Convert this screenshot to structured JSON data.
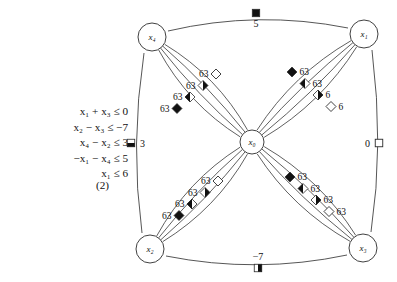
{
  "equations": {
    "lines": [
      "x₁ + x₃ ≤ 0",
      "x₂ − x₃ ≤ −7",
      "x₄ − x₂ ≤ 3",
      "−x₁ − x₄ ≤ 5",
      "x₁ ≤ 6"
    ],
    "number": "(2)"
  },
  "graph": {
    "nodes": [
      {
        "id": "x4",
        "label": "x₄",
        "x": 152,
        "y": 37
      },
      {
        "id": "x1",
        "label": "x₁",
        "x": 364,
        "y": 34
      },
      {
        "id": "x0",
        "label": "x₀",
        "x": 252,
        "y": 142
      },
      {
        "id": "x2",
        "label": "x₂",
        "x": 150,
        "y": 249
      },
      {
        "id": "x3",
        "label": "x₃",
        "x": 363,
        "y": 248
      }
    ],
    "outer_edges": [
      {
        "id": "x4-x1",
        "label": "5",
        "marker": "square-full",
        "label_pos": "below"
      },
      {
        "id": "x4-x2",
        "label": "3",
        "marker": "square-half-bottom",
        "label_pos": "right"
      },
      {
        "id": "x1-x3",
        "label": "0",
        "marker": "square-empty",
        "label_pos": "left"
      },
      {
        "id": "x2-x3",
        "label": "−7",
        "marker": "square-half-right",
        "label_pos": "above"
      }
    ],
    "clusters": [
      {
        "id": "upper-left",
        "between": [
          "x4",
          "x0"
        ],
        "label_side": "left",
        "markers": [
          {
            "label": "63",
            "fill": "diamond-empty"
          },
          {
            "label": "63",
            "fill": "diamond-half-right"
          },
          {
            "label": "63",
            "fill": "diamond-half-left"
          },
          {
            "label": "63",
            "fill": "diamond-full"
          }
        ]
      },
      {
        "id": "upper-right",
        "between": [
          "x1",
          "x0"
        ],
        "label_side": "right",
        "markers": [
          {
            "label": "63",
            "fill": "diamond-full"
          },
          {
            "label": "63",
            "fill": "diamond-half-left"
          },
          {
            "label": "6",
            "fill": "diamond-half-right"
          },
          {
            "label": "6",
            "fill": "diamond-empty"
          }
        ]
      },
      {
        "id": "lower-left",
        "between": [
          "x2",
          "x0"
        ],
        "label_side": "left",
        "markers": [
          {
            "label": "63",
            "fill": "diamond-empty"
          },
          {
            "label": "63",
            "fill": "diamond-half-right"
          },
          {
            "label": "63",
            "fill": "diamond-half-left"
          },
          {
            "label": "63",
            "fill": "diamond-full"
          }
        ]
      },
      {
        "id": "lower-right",
        "between": [
          "x3",
          "x0"
        ],
        "label_side": "right",
        "markers": [
          {
            "label": "63",
            "fill": "diamond-full"
          },
          {
            "label": "63",
            "fill": "diamond-half-left"
          },
          {
            "label": "63",
            "fill": "diamond-half-right"
          },
          {
            "label": "63",
            "fill": "diamond-empty"
          }
        ]
      }
    ]
  },
  "colors": {
    "stroke": "#2b2b2b",
    "fill_dark": "#111111",
    "fill_light": "#ffffff",
    "text": "#111111"
  }
}
